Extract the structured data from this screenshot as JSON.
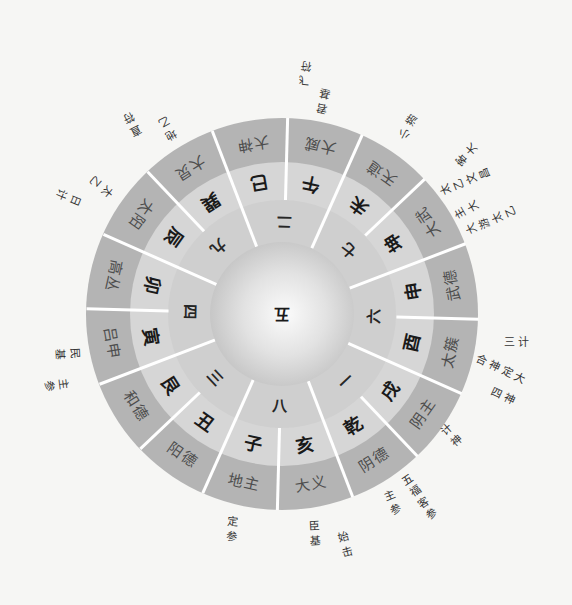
{
  "diagram": {
    "center_label": "五",
    "inner_ring": [
      "二",
      "七",
      "六",
      "一",
      "八",
      "三",
      "四",
      "九"
    ],
    "middle_ring": [
      "午",
      "未",
      "坤",
      "申",
      "酉",
      "戌",
      "乾",
      "亥",
      "子",
      "丑",
      "艮",
      "寅",
      "卯",
      "辰",
      "巽",
      "巳"
    ],
    "outer_ring": [
      "大威",
      "天道",
      "大武",
      "武德",
      "太簇",
      "阴主",
      "阴德",
      "大义",
      "地主",
      "阳德",
      "和德",
      "吕申",
      "高丛",
      "太阳",
      "大炅",
      "大神"
    ],
    "annotations": [
      {
        "text": "飞符"
      },
      {
        "text": "君基"
      },
      {
        "text": "小游"
      },
      {
        "text": "客大"
      },
      {
        "text": "太乙文昌"
      },
      {
        "text": "主大"
      },
      {
        "text": "大游太乙"
      },
      {
        "text": "三计"
      },
      {
        "text": "合神定大"
      },
      {
        "text": "四神"
      },
      {
        "text": "计神"
      },
      {
        "text": "五福客参"
      },
      {
        "text": "主参"
      },
      {
        "text": "始击"
      },
      {
        "text": "臣基"
      },
      {
        "text": "定参"
      },
      {
        "text": "民基"
      },
      {
        "text": "主参"
      },
      {
        "text": "日计"
      },
      {
        "text": "太乙"
      },
      {
        "text": "直符"
      },
      {
        "text": "地乙"
      }
    ]
  },
  "colors": {
    "background": "#f6f6f4",
    "outer_ring": "#b4b4b4",
    "middle_ring": "#d6d6d6",
    "inner_ring": "#cfcfcf",
    "center_edge": "#a9a9a9",
    "divider": "#ffffff"
  }
}
